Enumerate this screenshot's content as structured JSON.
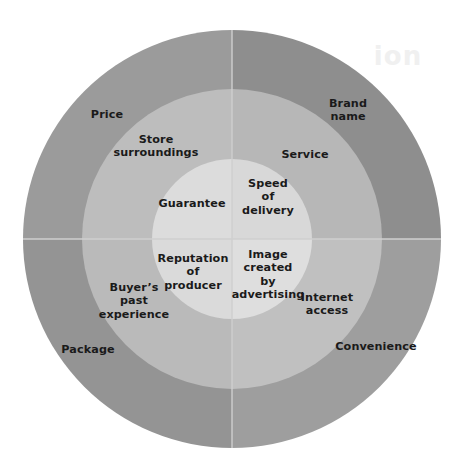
{
  "diagram": {
    "type": "concentric-circles",
    "background_color": "#ffffff",
    "center": {
      "x": 232,
      "y": 239
    },
    "rings": [
      {
        "name": "outer-ring",
        "radius": 209,
        "inner_radius": 150,
        "quadrant_colors": {
          "top_left": "#9b9b9b",
          "top_right": "#8e8e8e",
          "bottom_left": "#949494",
          "bottom_right": "#9e9e9e"
        },
        "labels": [
          {
            "id": "price",
            "text": "Price",
            "x": 107,
            "y": 115
          },
          {
            "id": "brand-name",
            "text": "Brand\nname",
            "x": 348,
            "y": 110
          },
          {
            "id": "package",
            "text": "Package",
            "x": 88,
            "y": 350
          },
          {
            "id": "convenience",
            "text": "Convenience",
            "x": 376,
            "y": 347
          }
        ]
      },
      {
        "name": "middle-ring",
        "radius": 150,
        "inner_radius": 80,
        "quadrant_colors": {
          "top_left": "#bdbdbd",
          "top_right": "#b7b7b7",
          "bottom_left": "#bababa",
          "bottom_right": "#c0c0c0"
        },
        "labels": [
          {
            "id": "store-surroundings",
            "text": "Store\nsurroundings",
            "x": 156,
            "y": 146
          },
          {
            "id": "service",
            "text": "Service",
            "x": 305,
            "y": 155
          },
          {
            "id": "buyers-past-experience",
            "text": "Buyer’s\npast\nexperience",
            "x": 134,
            "y": 301
          },
          {
            "id": "internet-access",
            "text": "Internet\naccess",
            "x": 327,
            "y": 304
          }
        ]
      },
      {
        "name": "inner-circle",
        "radius": 80,
        "inner_radius": 0,
        "quadrant_colors": {
          "top_left": "#dcdcdc",
          "top_right": "#d8d8d8",
          "bottom_left": "#dadada",
          "bottom_right": "#dedede"
        },
        "labels": [
          {
            "id": "guarantee",
            "text": "Guarantee",
            "x": 192,
            "y": 204
          },
          {
            "id": "speed-of-delivery",
            "text": "Speed\nof\ndelivery",
            "x": 268,
            "y": 197
          },
          {
            "id": "reputation-of-producer",
            "text": "Reputation\nof\nproducer",
            "x": 193,
            "y": 272
          },
          {
            "id": "image-created-by-advertising",
            "text": "Image\ncreated\nby\nadvertising",
            "x": 268,
            "y": 275
          }
        ]
      }
    ],
    "divider_color": "#cfcfcf",
    "ghost": {
      "text": "ion",
      "x": 398,
      "y": 56
    }
  }
}
